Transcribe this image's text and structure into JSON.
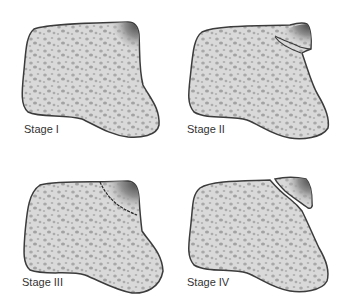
{
  "figure": {
    "colors": {
      "bone_fill": "#d9d9d9",
      "pore": "#a9a9a9",
      "outline": "#3c3c3c",
      "lesion_dark": "#5a5a5a",
      "background": "#ffffff"
    },
    "panels": [
      {
        "id": "stage-1",
        "label": "Stage I",
        "lesion": "shaded corner, intact"
      },
      {
        "id": "stage-2",
        "label": "Stage II",
        "lesion": "partial fissure"
      },
      {
        "id": "stage-3",
        "label": "Stage III",
        "lesion": "complete fracture line, non-displaced"
      },
      {
        "id": "stage-4",
        "label": "Stage IV",
        "lesion": "displaced fragment"
      }
    ]
  }
}
